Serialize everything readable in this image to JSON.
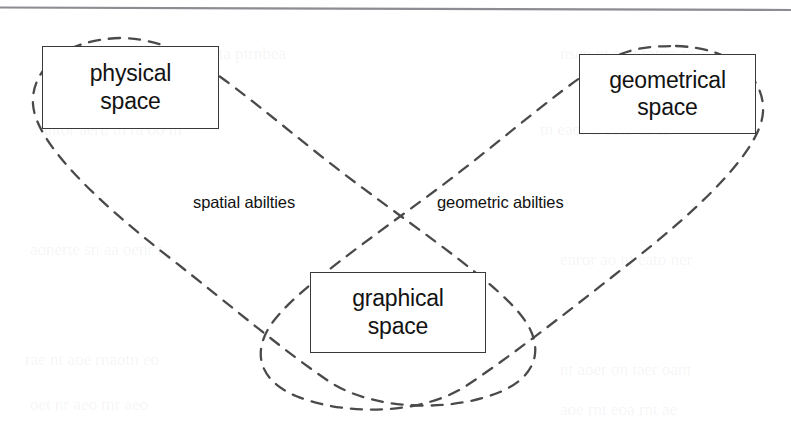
{
  "figure": {
    "type": "venn-style-diagram",
    "width": 791,
    "height": 423,
    "background_color": "#ffffff",
    "top_rule": {
      "name": "page-rule",
      "color": "#8c8c92",
      "y_left": 7,
      "y_right": 10
    }
  },
  "nodes": [
    {
      "id": "physical-space",
      "line1": "physical",
      "line2": "space",
      "box": {
        "x": 42,
        "y": 46,
        "w": 177,
        "h": 83
      },
      "border_color": "#3a3a3a",
      "fill_color": "#ffffff"
    },
    {
      "id": "geometrical-space",
      "line1": "geometrical",
      "line2": "space",
      "box": {
        "x": 579,
        "y": 54,
        "w": 177,
        "h": 80
      },
      "border_color": "#3a3a3a",
      "fill_color": "#ffffff"
    },
    {
      "id": "graphical-space",
      "line1": "graphical",
      "line2": "space",
      "box": {
        "x": 310,
        "y": 272,
        "w": 176,
        "h": 81
      },
      "border_color": "#3a3a3a",
      "fill_color": "#ffffff"
    }
  ],
  "regions": [
    {
      "id": "spatial-abilities",
      "label": "spatial abilties",
      "label_x": 193,
      "label_y": 193,
      "encloses": [
        "physical-space",
        "graphical-space"
      ],
      "stroke_color": "#4a4a4a",
      "stroke_style": "dashed"
    },
    {
      "id": "geometric-abilities",
      "label": "geometric abilties",
      "label_x": 437,
      "label_y": 193,
      "encloses": [
        "geometrical-space",
        "graphical-space"
      ],
      "stroke_color": "#4a4a4a",
      "stroke_style": "dashed"
    }
  ],
  "crossings": [
    {
      "name": "upper-crossing",
      "x": 397,
      "y": 194
    },
    {
      "name": "lower-crossing",
      "x": 396,
      "y": 386
    }
  ],
  "bleed_through": [
    {
      "text": "dnerrnsnt  ta   ptrnbea",
      "x": 150,
      "y": 44
    },
    {
      "text": "nseo  ot anu   rateo  ea",
      "x": 560,
      "y": 44
    },
    {
      "text": "antor  aeru  th  ra oo  m",
      "x": 40,
      "y": 120
    },
    {
      "text": "tn eaor  n  eotb  ae  ss",
      "x": 540,
      "y": 120
    },
    {
      "text": "aonerte  sn aa  oenr  t",
      "x": 30,
      "y": 240
    },
    {
      "text": "enror  ao  nt eato  ner",
      "x": 560,
      "y": 250
    },
    {
      "text": "rae nt  aoe  rnaotn eo",
      "x": 25,
      "y": 350
    },
    {
      "text": "nt  aoer  on  taer  oant",
      "x": 560,
      "y": 360
    },
    {
      "text": "oet  nr  aeo  tnr  aeo",
      "x": 30,
      "y": 395
    },
    {
      "text": "aoe  rnt  eoa  rnt  ae",
      "x": 560,
      "y": 400
    }
  ]
}
